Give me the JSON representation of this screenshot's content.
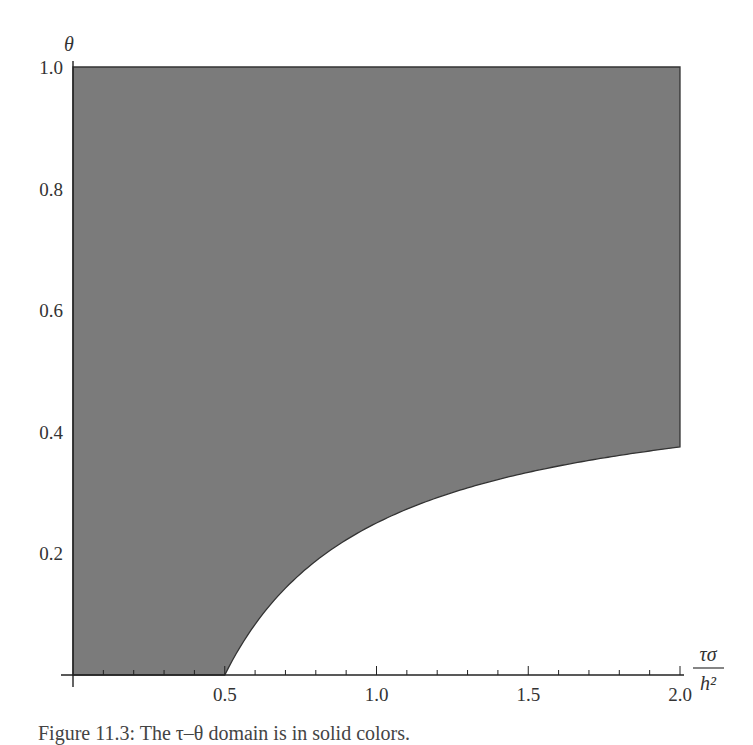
{
  "chart_data": {
    "type": "area",
    "title": "",
    "xlabel": "τσ/h²",
    "xlabel_numerator": "τσ",
    "xlabel_denominator": "h²",
    "ylabel": "θ",
    "xlim": [
      0,
      2.0
    ],
    "ylim": [
      0,
      1.0
    ],
    "x_ticks": [
      0.5,
      1.0,
      1.5,
      2.0
    ],
    "x_tick_labels": [
      "0.5",
      "1.0",
      "1.5",
      "2.0"
    ],
    "x_minor_tick_step": 0.1,
    "y_ticks": [
      0.2,
      0.4,
      0.6,
      0.8,
      1.0
    ],
    "y_tick_labels": [
      "0.2",
      "0.4",
      "0.6",
      "0.8",
      "1.0"
    ],
    "grid": false,
    "legend": null,
    "fill_color": "#7b7b7b",
    "boundary_color": "#333333",
    "region_description": "Shaded stable region: theta >= 1/2 - h^2/(4 tau sigma) for tau sigma/h^2 > 0.5; full height for tau sigma/h^2 <= 0.5",
    "boundary_curve": {
      "formula": "theta = 0.5 - 1/(4x)",
      "x": [
        0.5,
        0.6,
        0.7,
        0.8,
        0.9,
        1.0,
        1.2,
        1.4,
        1.6,
        1.8,
        2.0
      ],
      "y": [
        0.0,
        0.083,
        0.143,
        0.188,
        0.222,
        0.25,
        0.292,
        0.321,
        0.344,
        0.361,
        0.375
      ]
    }
  },
  "caption": "Figure 11.3: The τ–θ domain is in solid colors."
}
